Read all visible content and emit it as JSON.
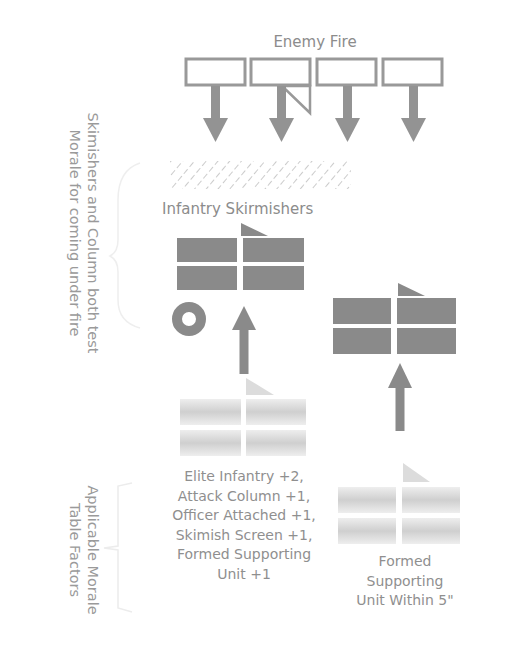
{
  "title": "Enemy Fire",
  "skirmishers_label": "Infantry Skirmishers",
  "side_notes": {
    "top": [
      "Skimishers and Column both test",
      "Morale for coming under fire"
    ],
    "bottom": [
      "Applicable Morale",
      "Table Factors"
    ]
  },
  "factors_list": [
    "Elite Infantry +2,",
    "Attack Column +1,",
    "Officer Attached +1,",
    "Skimish Screen +1,",
    "Formed Supporting",
    "Unit +1"
  ],
  "supporting_label": [
    "Formed",
    "Supporting",
    "Unit Within 5\""
  ],
  "colors": {
    "unit_fill": "#8a8a8a",
    "faded_fill": "#d6d6d6",
    "outline": "#9a9a9a",
    "text": "#8c8c8c"
  }
}
